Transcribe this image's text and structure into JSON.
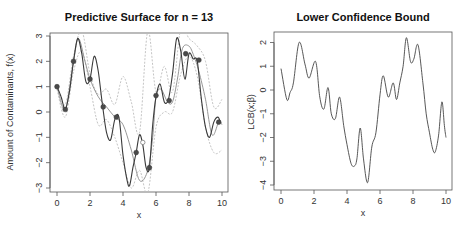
{
  "chart_data": [
    {
      "type": "line",
      "title": "Predictive Surface for n = 13",
      "xlabel": "x",
      "ylabel": "Amount of Contaminants, f(x)",
      "xlim": [
        0,
        10
      ],
      "ylim": [
        -3,
        3
      ],
      "xticks": [
        "0",
        "2",
        "4",
        "6",
        "8",
        "10"
      ],
      "yticks": [
        "-3",
        "-2",
        "-1",
        "0",
        "1",
        "2",
        "3"
      ],
      "grid": false,
      "series": [
        {
          "name": "true function",
          "style": "solid-dark",
          "x": [
            0,
            0.25,
            0.5,
            0.75,
            1.0,
            1.25,
            1.5,
            1.75,
            2.0,
            2.25,
            2.5,
            2.75,
            3.0,
            3.25,
            3.5,
            3.75,
            4.0,
            4.25,
            4.4,
            4.6,
            4.8,
            5.0,
            5.2,
            5.4,
            5.6,
            5.8,
            6.0,
            6.25,
            6.5,
            6.75,
            7.0,
            7.25,
            7.5,
            7.75,
            8.0,
            8.25,
            8.5,
            8.75,
            9.0,
            9.25,
            9.5,
            9.75,
            9.9
          ],
          "y": [
            1.0,
            0.6,
            0.1,
            0.8,
            2.0,
            2.9,
            2.3,
            1.2,
            1.3,
            2.2,
            1.6,
            0.3,
            -0.8,
            -1.1,
            -0.3,
            -0.2,
            -1.7,
            -2.7,
            -2.9,
            -2.2,
            -1.6,
            -0.9,
            -1.3,
            -2.2,
            -2.2,
            -0.5,
            0.6,
            1.1,
            0.4,
            0.5,
            1.5,
            2.9,
            2.4,
            1.3,
            2.3,
            2.1,
            2.0,
            0.5,
            -0.6,
            -1.0,
            -0.4,
            -0.2,
            -0.4
          ]
        },
        {
          "name": "predictive mean",
          "style": "solid-gray",
          "x": [
            0,
            0.5,
            1.0,
            1.3,
            1.7,
            2.0,
            2.5,
            3.0,
            3.5,
            4.0,
            4.5,
            5.0,
            5.5,
            5.8,
            6.0,
            6.3,
            6.7,
            7.0,
            7.3,
            7.6,
            8.0,
            8.3,
            8.6,
            9.0,
            9.4,
            9.8,
            10
          ],
          "y": [
            1.0,
            0.1,
            2.0,
            2.9,
            2.0,
            1.3,
            0.6,
            0.2,
            -0.2,
            -0.5,
            -1.5,
            -2.7,
            -2.3,
            -1.0,
            0.6,
            0.9,
            0.4,
            0.4,
            1.3,
            2.5,
            2.6,
            2.2,
            1.6,
            0.5,
            -0.9,
            -0.4,
            -0.5
          ]
        },
        {
          "name": "90% interval (upper)",
          "style": "dashed-light",
          "x": [
            0,
            0.5,
            1.0,
            1.5,
            2.0,
            2.5,
            3.0,
            3.5,
            4.0,
            4.5,
            5.0,
            5.5,
            6.0,
            6.5,
            7.0,
            7.5,
            8.0,
            8.5,
            9.0,
            9.5,
            10
          ],
          "y": [
            1.1,
            0.3,
            2.2,
            3.2,
            1.5,
            0.7,
            0.9,
            0.3,
            1.4,
            0.4,
            -0.8,
            3.2,
            0.8,
            1.8,
            0.8,
            3.3,
            2.9,
            2.6,
            2.0,
            0.2,
            0.5
          ]
        },
        {
          "name": "90% interval (lower)",
          "style": "dashed-light",
          "x": [
            0,
            0.5,
            1.0,
            1.5,
            2.0,
            2.5,
            3.0,
            3.5,
            4.0,
            4.5,
            5.0,
            5.5,
            6.0,
            6.5,
            7.0,
            7.5,
            8.0,
            8.5,
            9.0,
            9.5,
            10
          ],
          "y": [
            0.9,
            -0.2,
            1.6,
            2.4,
            1.0,
            -0.5,
            -0.3,
            -1.0,
            -2.0,
            -3.0,
            -2.3,
            -3.2,
            -0.6,
            0.0,
            0.0,
            1.5,
            2.2,
            1.4,
            -0.6,
            -1.6,
            -1.5
          ]
        }
      ],
      "points": {
        "name": "observations (n = 13)",
        "x": [
          0,
          0.5,
          1.0,
          2.0,
          2.8,
          3.6,
          4.8,
          5.6,
          6.0,
          6.8,
          7.8,
          8.6,
          9.8
        ],
        "y": [
          1.0,
          0.1,
          2.0,
          1.3,
          0.2,
          -0.2,
          -1.6,
          -2.2,
          0.65,
          0.45,
          2.3,
          2.05,
          -0.4
        ]
      },
      "candidate_point": {
        "x": 5.2,
        "y": -1.2
      }
    },
    {
      "type": "line",
      "title": "Lower Confidence Bound",
      "xlabel": "x",
      "ylabel": "LCB(x;β)",
      "xlim": [
        0,
        10
      ],
      "ylim": [
        -4,
        2
      ],
      "xticks": [
        "0",
        "2",
        "4",
        "6",
        "8",
        "10"
      ],
      "yticks": [
        "-4",
        "-3",
        "-2",
        "-1",
        "0",
        "1",
        "2"
      ],
      "grid": false,
      "series": [
        {
          "name": "LCB",
          "x": [
            0,
            0.35,
            0.55,
            0.75,
            1.1,
            1.45,
            1.7,
            2.1,
            2.35,
            2.6,
            2.85,
            3.05,
            3.3,
            3.55,
            3.8,
            4.0,
            4.25,
            4.45,
            4.6,
            4.8,
            5.0,
            5.25,
            5.5,
            5.75,
            6.0,
            6.2,
            6.5,
            6.8,
            7.0,
            7.2,
            7.4,
            7.6,
            7.85,
            8.05,
            8.3,
            8.6,
            8.8,
            9.0,
            9.2,
            9.35,
            9.55,
            9.75,
            9.9,
            10.0
          ],
          "y": [
            0.9,
            -0.4,
            -0.1,
            0.3,
            2.0,
            1.1,
            0.5,
            1.2,
            -0.3,
            -0.8,
            0.1,
            -1.0,
            -1.2,
            -0.3,
            -1.5,
            -2.3,
            -3.1,
            -3.2,
            -2.9,
            -1.6,
            -2.9,
            -3.9,
            -2.4,
            -1.8,
            -0.2,
            0.6,
            -0.3,
            0.3,
            -0.4,
            0.3,
            1.0,
            2.2,
            1.2,
            1.3,
            1.9,
            0.3,
            -1.0,
            -1.8,
            -2.5,
            -2.6,
            -1.9,
            -0.5,
            -1.5,
            -2.0
          ]
        }
      ]
    }
  ]
}
